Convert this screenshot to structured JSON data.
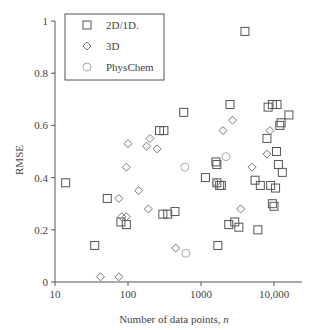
{
  "chart_data": {
    "type": "scatter",
    "title": "",
    "xlabel": "Number of data points, n",
    "ylabel": "RMSE",
    "xscale": "log",
    "xlim": [
      10,
      20000
    ],
    "ylim": [
      0,
      1
    ],
    "xticks": [
      10,
      100,
      1000,
      10000
    ],
    "xtick_labels": [
      "10",
      "100",
      "1000",
      "10,000"
    ],
    "yticks": [
      0,
      0.2,
      0.4,
      0.6,
      0.8,
      1
    ],
    "ytick_labels": [
      "0",
      "0.2",
      "0.4",
      "0.6",
      "0.8",
      "1"
    ],
    "grid": false,
    "legend_position": "upper left",
    "series": [
      {
        "name": "2D/1D.",
        "marker": "square",
        "color": "#555555",
        "points": [
          [
            14,
            0.38
          ],
          [
            35,
            0.14
          ],
          [
            52,
            0.32
          ],
          [
            80,
            0.23
          ],
          [
            95,
            0.22
          ],
          [
            270,
            0.58
          ],
          [
            310,
            0.58
          ],
          [
            300,
            0.26
          ],
          [
            350,
            0.26
          ],
          [
            440,
            0.27
          ],
          [
            580,
            0.65
          ],
          [
            1150,
            0.4
          ],
          [
            1600,
            0.46
          ],
          [
            1650,
            0.45
          ],
          [
            1650,
            0.38
          ],
          [
            1800,
            0.37
          ],
          [
            1900,
            0.37
          ],
          [
            1700,
            0.14
          ],
          [
            2500,
            0.68
          ],
          [
            2400,
            0.22
          ],
          [
            2900,
            0.23
          ],
          [
            3300,
            0.21
          ],
          [
            4000,
            0.96
          ],
          [
            5500,
            0.39
          ],
          [
            6500,
            0.37
          ],
          [
            6000,
            0.2
          ],
          [
            8000,
            0.55
          ],
          [
            8300,
            0.67
          ],
          [
            9500,
            0.68
          ],
          [
            11000,
            0.68
          ],
          [
            9000,
            0.37
          ],
          [
            10500,
            0.36
          ],
          [
            12000,
            0.6
          ],
          [
            12500,
            0.61
          ],
          [
            9500,
            0.3
          ],
          [
            10000,
            0.29
          ],
          [
            11500,
            0.45
          ],
          [
            10800,
            0.5
          ],
          [
            13000,
            0.42
          ],
          [
            16000,
            0.64
          ]
        ]
      },
      {
        "name": "3D",
        "marker": "diamond",
        "color": "#777777",
        "points": [
          [
            42,
            0.02
          ],
          [
            75,
            0.02
          ],
          [
            75,
            0.32
          ],
          [
            82,
            0.25
          ],
          [
            95,
            0.25
          ],
          [
            95,
            0.44
          ],
          [
            100,
            0.53
          ],
          [
            140,
            0.35
          ],
          [
            180,
            0.52
          ],
          [
            190,
            0.28
          ],
          [
            200,
            0.55
          ],
          [
            250,
            0.51
          ],
          [
            450,
            0.13
          ],
          [
            1600,
            0.38
          ],
          [
            2000,
            0.58
          ],
          [
            2700,
            0.62
          ],
          [
            3500,
            0.28
          ],
          [
            5000,
            0.44
          ],
          [
            8000,
            0.49
          ],
          [
            8800,
            0.58
          ]
        ]
      },
      {
        "name": "PhysChem",
        "marker": "circle",
        "color": "#aaaaaa",
        "points": [
          [
            600,
            0.44
          ],
          [
            620,
            0.11
          ],
          [
            2200,
            0.48
          ]
        ]
      }
    ]
  },
  "legend": {
    "items": [
      {
        "label": "2D/1D."
      },
      {
        "label": "3D"
      },
      {
        "label": "PhysChem"
      }
    ]
  },
  "axes": {
    "xlabel_prefix": "Number of data points, ",
    "xlabel_var": "n",
    "ylabel": "RMSE"
  }
}
